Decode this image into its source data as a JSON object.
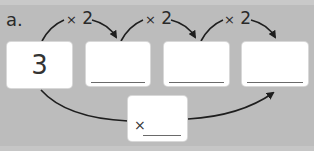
{
  "exercise": {
    "label": "a.",
    "start_value": "3",
    "steps": [
      {
        "operator": "×",
        "factor": "2"
      },
      {
        "operator": "×",
        "factor": "2"
      },
      {
        "operator": "×",
        "factor": "2"
      }
    ],
    "answer_boxes": [
      "",
      "",
      ""
    ],
    "combined": {
      "operator": "×",
      "value": ""
    }
  },
  "colors": {
    "background": "#bcbcbc",
    "box": "#ffffff",
    "arrow": "#1e1e1e",
    "underline": "#6a6a6a"
  }
}
